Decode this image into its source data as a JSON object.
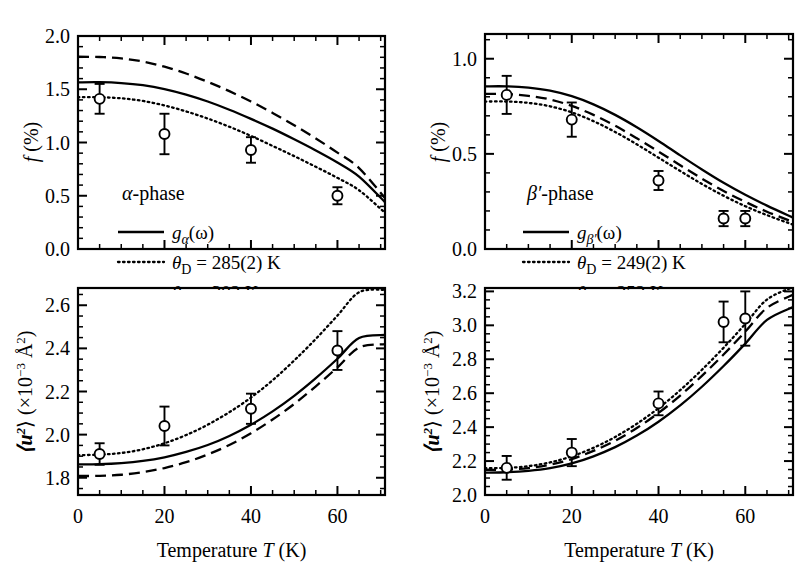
{
  "figure": {
    "background": "#ffffff",
    "foreground": "#000000",
    "width": 811,
    "height": 587
  },
  "axis_titles": {
    "x": "Temperature",
    "x_symbol": "T",
    "x_unit": "(K)",
    "y_f_symbol": "f",
    "y_f_unit": "(%)",
    "y_u_symbol": "⟨u²⟩",
    "y_u_unit": "(×10⁻³ Å²)"
  },
  "panels": [
    {
      "id": "top-left",
      "phase_label": "α-phase",
      "legend": [
        {
          "style": "solid",
          "label": "g",
          "sub": "α",
          "tail": "(ω)",
          "full": "gα(ω)"
        },
        {
          "style": "dotted",
          "label": "θ",
          "sub": "D",
          "tail": " = 285(2) K",
          "full": "θD = 285(2) K"
        },
        {
          "style": "dashed",
          "label": "θ",
          "sub": "D",
          "tail": " = 302 K",
          "full": "θD = 302 K"
        }
      ],
      "ytick_labels": [
        "0.0",
        "0.5",
        "1.0",
        "1.5",
        "2.0"
      ]
    },
    {
      "id": "bottom-left",
      "phase_label": "",
      "legend": [],
      "ytick_labels": [
        "1.8",
        "2.0",
        "2.2",
        "2.4",
        "2.6"
      ],
      "xtick_labels": [
        "0",
        "20",
        "40",
        "60"
      ]
    },
    {
      "id": "top-right",
      "phase_label": "β′-phase",
      "legend": [
        {
          "style": "solid",
          "label": "g",
          "sub": "β′",
          "tail": "(ω)",
          "full": "gβ′(ω)"
        },
        {
          "style": "dotted",
          "label": "θ",
          "sub": "D",
          "tail": " = 249(2) K",
          "full": "θD = 249(2) K"
        },
        {
          "style": "dashed",
          "label": "θ",
          "sub": "D",
          "tail": " = 252 K",
          "full": "θD = 252 K"
        }
      ],
      "ytick_labels": [
        "0.0",
        "0.5",
        "1.0"
      ]
    },
    {
      "id": "bottom-right",
      "phase_label": "",
      "legend": [],
      "ytick_labels": [
        "2.0",
        "2.2",
        "2.4",
        "2.6",
        "2.8",
        "3.0",
        "3.2"
      ],
      "xtick_labels": [
        "0",
        "20",
        "40",
        "60"
      ]
    }
  ],
  "chart_data": [
    {
      "id": "top-left",
      "type": "scatter",
      "title": "α-phase",
      "xlabel": "Temperature T (K)",
      "ylabel": "f (%)",
      "xlim": [
        0,
        71
      ],
      "ylim": [
        0.0,
        2.0
      ],
      "xticks": [
        0,
        20,
        40,
        60
      ],
      "yticks": [
        0.0,
        0.5,
        1.0,
        1.5,
        2.0
      ],
      "xminor": 5,
      "yminor": 0.1,
      "grid": false,
      "legend_position": "lower-left",
      "points": {
        "x": [
          5,
          20,
          40,
          60
        ],
        "y": [
          1.41,
          1.08,
          0.93,
          0.5
        ],
        "yerr": [
          0.14,
          0.19,
          0.12,
          0.08
        ]
      },
      "series": [
        {
          "name": "gα(ω)",
          "style": "solid",
          "x": [
            0,
            5,
            10,
            15,
            20,
            25,
            30,
            35,
            40,
            45,
            50,
            55,
            60,
            65,
            71
          ],
          "y": [
            1.565,
            1.566,
            1.558,
            1.538,
            1.502,
            1.45,
            1.385,
            1.308,
            1.222,
            1.13,
            1.03,
            0.925,
            0.812,
            0.68,
            0.44
          ]
        },
        {
          "name": "θD = 285(2) K",
          "style": "dotted",
          "x": [
            0,
            5,
            10,
            15,
            20,
            25,
            30,
            35,
            40,
            45,
            50,
            55,
            60,
            65,
            71
          ],
          "y": [
            1.425,
            1.425,
            1.415,
            1.39,
            1.348,
            1.292,
            1.225,
            1.148,
            1.062,
            0.968,
            0.872,
            0.772,
            0.668,
            0.552,
            0.34
          ]
        },
        {
          "name": "θD = 302 K",
          "style": "dashed",
          "x": [
            0,
            5,
            10,
            15,
            20,
            25,
            30,
            35,
            40,
            45,
            50,
            55,
            60,
            65,
            71
          ],
          "y": [
            1.805,
            1.803,
            1.79,
            1.76,
            1.712,
            1.648,
            1.57,
            1.482,
            1.385,
            1.278,
            1.162,
            1.038,
            0.905,
            0.76,
            0.478
          ]
        }
      ]
    },
    {
      "id": "bottom-left",
      "type": "scatter",
      "title": "",
      "xlabel": "Temperature T (K)",
      "ylabel": "⟨u²⟩ (×10⁻³ Å²)",
      "xlim": [
        0,
        71
      ],
      "ylim": [
        1.72,
        2.68
      ],
      "xticks": [
        0,
        20,
        40,
        60
      ],
      "yticks": [
        1.8,
        2.0,
        2.2,
        2.4,
        2.6
      ],
      "xminor": 5,
      "yminor": 0.05,
      "grid": false,
      "points": {
        "x": [
          5,
          20,
          40,
          60
        ],
        "y": [
          1.91,
          2.04,
          2.12,
          2.39
        ],
        "yerr": [
          0.05,
          0.09,
          0.07,
          0.09
        ]
      },
      "series": [
        {
          "name": "gα(ω)",
          "style": "solid",
          "x": [
            0,
            5,
            10,
            15,
            20,
            25,
            30,
            35,
            40,
            45,
            50,
            55,
            60,
            65,
            71
          ],
          "y": [
            1.862,
            1.863,
            1.868,
            1.878,
            1.895,
            1.92,
            1.952,
            1.994,
            2.046,
            2.108,
            2.18,
            2.262,
            2.352,
            2.448,
            2.462
          ]
        },
        {
          "name": "θD = 285(2) K",
          "style": "dotted",
          "x": [
            0,
            5,
            10,
            15,
            20,
            25,
            30,
            35,
            40,
            45,
            50,
            55,
            60,
            65,
            71
          ],
          "y": [
            1.905,
            1.907,
            1.915,
            1.932,
            1.96,
            1.998,
            2.046,
            2.104,
            2.172,
            2.252,
            2.344,
            2.444,
            2.552,
            2.66,
            2.672
          ]
        },
        {
          "name": "θD = 302 K",
          "style": "dashed",
          "x": [
            0,
            5,
            10,
            15,
            20,
            25,
            30,
            35,
            40,
            45,
            50,
            55,
            60,
            65,
            71
          ],
          "y": [
            1.808,
            1.809,
            1.814,
            1.826,
            1.845,
            1.872,
            1.908,
            1.952,
            2.006,
            2.07,
            2.142,
            2.224,
            2.312,
            2.404,
            2.42
          ]
        }
      ]
    },
    {
      "id": "top-right",
      "type": "scatter",
      "title": "β′-phase",
      "xlabel": "Temperature T (K)",
      "ylabel": "f (%)",
      "xlim": [
        0,
        71
      ],
      "ylim": [
        0.0,
        1.13
      ],
      "xticks": [
        0,
        20,
        40,
        60
      ],
      "yticks": [
        0.0,
        0.5,
        1.0
      ],
      "xminor": 5,
      "yminor": 0.1,
      "grid": false,
      "legend_position": "lower-left",
      "points": {
        "x": [
          5,
          20,
          40,
          55,
          60
        ],
        "y": [
          0.81,
          0.68,
          0.36,
          0.16,
          0.16
        ],
        "yerr": [
          0.1,
          0.09,
          0.05,
          0.04,
          0.04
        ]
      },
      "series": [
        {
          "name": "gβ′(ω)",
          "style": "solid",
          "x": [
            0,
            5,
            10,
            15,
            20,
            25,
            30,
            35,
            40,
            45,
            50,
            55,
            60,
            65,
            71
          ],
          "y": [
            0.855,
            0.855,
            0.848,
            0.832,
            0.803,
            0.76,
            0.705,
            0.64,
            0.568,
            0.492,
            0.418,
            0.348,
            0.285,
            0.228,
            0.165
          ]
        },
        {
          "name": "θD = 249(2) K",
          "style": "dotted",
          "x": [
            0,
            5,
            10,
            15,
            20,
            25,
            30,
            35,
            40,
            45,
            50,
            55,
            60,
            65,
            71
          ],
          "y": [
            0.775,
            0.775,
            0.768,
            0.75,
            0.718,
            0.672,
            0.615,
            0.55,
            0.48,
            0.41,
            0.342,
            0.28,
            0.225,
            0.178,
            0.128
          ]
        },
        {
          "name": "θD = 252 K",
          "style": "dashed",
          "x": [
            0,
            5,
            10,
            15,
            20,
            25,
            30,
            35,
            40,
            45,
            50,
            55,
            60,
            65,
            71
          ],
          "y": [
            0.815,
            0.814,
            0.805,
            0.786,
            0.752,
            0.705,
            0.648,
            0.582,
            0.512,
            0.44,
            0.37,
            0.305,
            0.248,
            0.196,
            0.142
          ]
        }
      ]
    },
    {
      "id": "bottom-right",
      "type": "scatter",
      "title": "",
      "xlabel": "Temperature T (K)",
      "ylabel": "⟨u²⟩ (×10⁻³ Å²)",
      "xlim": [
        0,
        71
      ],
      "ylim": [
        2.0,
        3.22
      ],
      "xticks": [
        0,
        20,
        40,
        60
      ],
      "yticks": [
        2.0,
        2.2,
        2.4,
        2.6,
        2.8,
        3.0,
        3.2
      ],
      "xminor": 5,
      "yminor": 0.05,
      "grid": false,
      "points": {
        "x": [
          5,
          20,
          40,
          55,
          60
        ],
        "y": [
          2.16,
          2.25,
          2.54,
          3.02,
          3.04
        ],
        "yerr": [
          0.07,
          0.08,
          0.07,
          0.12,
          0.16
        ]
      },
      "series": [
        {
          "name": "gβ′(ω)",
          "style": "solid",
          "x": [
            0,
            5,
            10,
            15,
            20,
            25,
            30,
            35,
            40,
            45,
            50,
            55,
            60,
            65,
            71
          ],
          "y": [
            2.132,
            2.134,
            2.142,
            2.158,
            2.186,
            2.228,
            2.282,
            2.35,
            2.432,
            2.528,
            2.638,
            2.76,
            2.892,
            3.032,
            3.108
          ]
        },
        {
          "name": "θD = 249(2) K",
          "style": "dotted",
          "x": [
            0,
            5,
            10,
            15,
            20,
            25,
            30,
            35,
            40,
            45,
            50,
            55,
            60,
            65,
            71
          ],
          "y": [
            2.158,
            2.16,
            2.17,
            2.192,
            2.228,
            2.278,
            2.342,
            2.42,
            2.512,
            2.618,
            2.738,
            2.868,
            3.008,
            3.152,
            3.225
          ]
        },
        {
          "name": "θD = 252 K",
          "style": "dashed",
          "x": [
            0,
            5,
            10,
            15,
            20,
            25,
            30,
            35,
            40,
            45,
            50,
            55,
            60,
            65,
            71
          ],
          "y": [
            2.148,
            2.15,
            2.159,
            2.179,
            2.212,
            2.26,
            2.32,
            2.395,
            2.484,
            2.586,
            2.702,
            2.828,
            2.963,
            3.103,
            3.18
          ]
        }
      ]
    }
  ]
}
